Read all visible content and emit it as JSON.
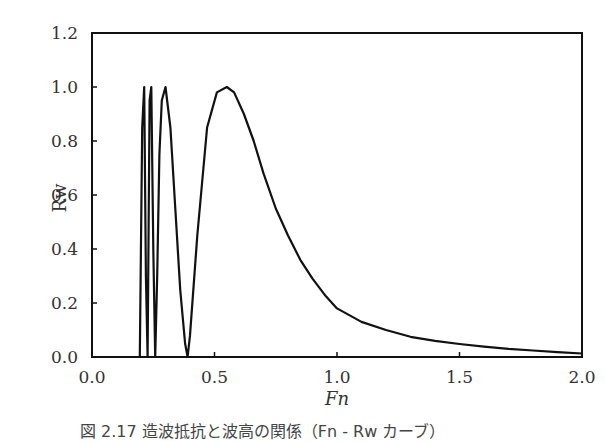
{
  "chart_data": {
    "type": "line",
    "title": "",
    "xlabel": "Fn",
    "ylabel": "Rw",
    "xlim": [
      0.0,
      2.0
    ],
    "ylim": [
      0.0,
      1.2
    ],
    "x_ticks": [
      "0.0",
      "0.5",
      "1.0",
      "1.5",
      "2.0"
    ],
    "y_ticks": [
      "0.0",
      "0.2",
      "0.4",
      "0.6",
      "0.8",
      "1.0",
      "1.2"
    ],
    "grid": false,
    "legend": null,
    "series": [
      {
        "name": "Rw",
        "x": [
          0.195,
          0.205,
          0.213,
          0.22,
          0.227,
          0.235,
          0.242,
          0.25,
          0.258,
          0.266,
          0.275,
          0.285,
          0.3,
          0.32,
          0.34,
          0.36,
          0.38,
          0.39,
          0.4,
          0.43,
          0.47,
          0.51,
          0.55,
          0.58,
          0.62,
          0.66,
          0.7,
          0.75,
          0.8,
          0.85,
          0.9,
          0.95,
          1.0,
          1.1,
          1.2,
          1.3,
          1.4,
          1.5,
          1.6,
          1.7,
          1.8,
          1.9,
          2.0
        ],
        "y": [
          0.0,
          0.85,
          1.0,
          0.3,
          0.0,
          0.95,
          1.0,
          0.4,
          0.0,
          0.3,
          0.75,
          0.95,
          1.0,
          0.85,
          0.55,
          0.25,
          0.05,
          0.0,
          0.08,
          0.45,
          0.85,
          0.98,
          1.0,
          0.98,
          0.9,
          0.8,
          0.68,
          0.55,
          0.45,
          0.36,
          0.29,
          0.23,
          0.18,
          0.13,
          0.1,
          0.075,
          0.06,
          0.048,
          0.038,
          0.03,
          0.024,
          0.018,
          0.013
        ]
      }
    ]
  },
  "axes": {
    "xlabel": "Fn",
    "ylabel": "Rw",
    "x_ticks": [
      "0.0",
      "0.5",
      "1.0",
      "1.5",
      "2.0"
    ],
    "y_ticks": [
      "0.0",
      "0.2",
      "0.4",
      "0.6",
      "0.8",
      "1.0",
      "1.2"
    ]
  },
  "caption": "図 2.17 造波抵抗と波高の関係（Fn - Rw カーブ）"
}
